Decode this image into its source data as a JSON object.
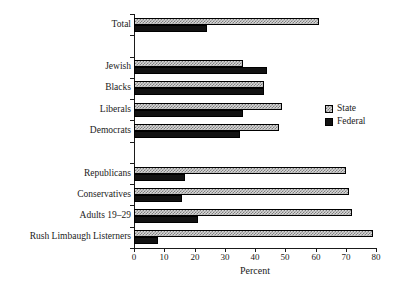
{
  "chart_data": {
    "type": "bar",
    "orientation": "horizontal",
    "title": "",
    "xlabel": "Percent",
    "ylabel": "",
    "xlim": [
      0,
      80
    ],
    "xticks": [
      0,
      10,
      20,
      30,
      40,
      50,
      60,
      70,
      80
    ],
    "grid": false,
    "legend_position": "right",
    "categories": [
      "Total",
      "Jewish",
      "Blacks",
      "Liberals",
      "Democrats",
      "Republicans",
      "Conservatives",
      "Adults 19–29",
      "Rush Limbaugh Listerners"
    ],
    "series": [
      {
        "name": "State",
        "values": [
          61,
          36,
          43,
          49,
          48,
          70,
          71,
          72,
          79
        ]
      },
      {
        "name": "Federal",
        "values": [
          24,
          44,
          43,
          36,
          35,
          17,
          16,
          21,
          8
        ]
      }
    ],
    "group_breaks_after": [
      "Total",
      "Democrats"
    ],
    "colors": {
      "state_fill": "#d8d8d8",
      "state_hatch": "#7e7e7e",
      "federal_fill": "#121212",
      "axis": "#1a1a1a",
      "background": "#ffffff"
    }
  },
  "legend": {
    "items": [
      {
        "label": "State",
        "swatch": "hatched-gray-swatch"
      },
      {
        "label": "Federal",
        "swatch": "solid-black-swatch"
      }
    ]
  },
  "axis": {
    "x_title": "Percent",
    "x_tick_labels": [
      "0",
      "10",
      "20",
      "30",
      "40",
      "50",
      "60",
      "70",
      "80"
    ]
  }
}
